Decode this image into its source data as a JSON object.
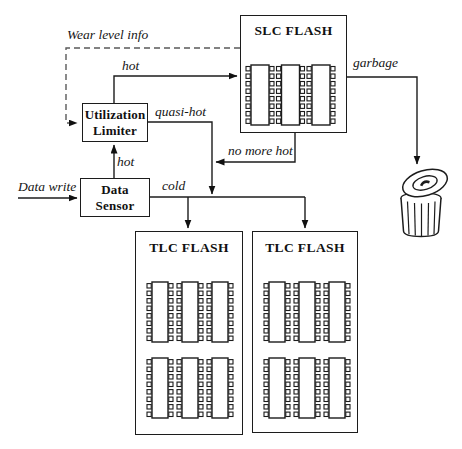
{
  "diagram": {
    "colors": {
      "background": "#ffffff",
      "line": "#1c1c1c",
      "dashed_line": "#5a5a5a",
      "text": "#111111"
    },
    "boxes": {
      "slc_flash": {
        "title": "SLC FLASH"
      },
      "utilization_limiter": {
        "title_line1": "Utilization",
        "title_line2": "Limiter"
      },
      "data_sensor": {
        "title_line1": "Data",
        "title_line2": "Sensor"
      },
      "tlc_flash_left": {
        "title": "TLC FLASH"
      },
      "tlc_flash_right": {
        "title": "TLC FLASH"
      }
    },
    "edge_labels": {
      "wear_level_info": "Wear level info",
      "hot_to_slc": "hot",
      "hot_from_sensor": "hot",
      "quasi_hot": "quasi-hot",
      "no_more_hot": "no more hot",
      "data_write": "Data write",
      "cold": "cold",
      "garbage": "garbage"
    },
    "chips": {
      "pins_per_side": 8,
      "slc": {
        "rows": 1,
        "cols": 3
      },
      "tlc": {
        "rows": 2,
        "cols": 3
      }
    }
  }
}
